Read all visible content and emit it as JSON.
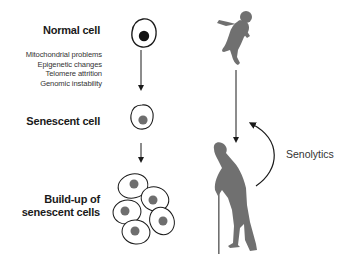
{
  "labels": {
    "normal_cell": "Normal cell",
    "senescent_cell": "Senescent cell",
    "buildup_line1": "Build-up of",
    "buildup_line2": "senescent cells",
    "senolytics": "Senolytics"
  },
  "causes": [
    "Mitochondrial problems",
    "Epigenetic changes",
    "Telomere attrition",
    "Genomic instability"
  ],
  "icons": {
    "normal_cell": "cell-black-nucleus",
    "senescent_cell": "cell-gray-nucleus",
    "cell_cluster": "cluster-of-senescent-cells",
    "baby": "baby-silhouette",
    "elderly": "elderly-person-with-cane-silhouette",
    "senolytics_arrow": "curved-arrow-up"
  },
  "colors": {
    "silhouette": "#707070",
    "nucleus_normal": "#111111",
    "nucleus_senescent": "#6e6e6e",
    "line": "#1a1a1a"
  }
}
